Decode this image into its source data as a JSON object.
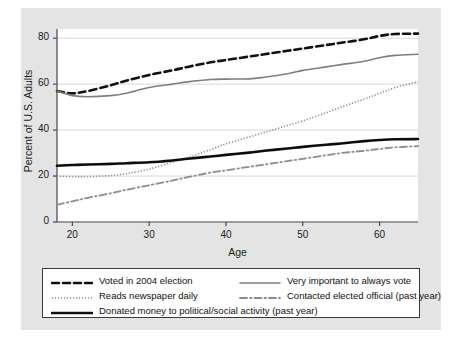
{
  "chart_data": {
    "type": "line",
    "title": "",
    "xlabel": "Age",
    "ylabel": "Percent of U.S. Adults",
    "xlim": [
      18,
      65
    ],
    "ylim": [
      0,
      84
    ],
    "grid": true,
    "legend_position": "below-plot",
    "xticks": [
      20,
      30,
      40,
      50,
      60
    ],
    "yticks": [
      0,
      20,
      40,
      60,
      80
    ],
    "x": [
      18,
      20,
      22,
      25,
      27,
      30,
      33,
      35,
      38,
      40,
      43,
      45,
      48,
      50,
      53,
      55,
      58,
      60,
      62,
      65
    ],
    "series": [
      {
        "name": "Voted in 2004 election",
        "style": "dashed",
        "color": "#111111",
        "width": 2.6,
        "values": [
          57.0,
          56.0,
          57.0,
          59.5,
          61.5,
          64.0,
          66.0,
          67.5,
          69.5,
          70.5,
          72.0,
          73.0,
          74.5,
          75.5,
          77.0,
          78.0,
          79.5,
          81.0,
          81.8,
          82.0
        ]
      },
      {
        "name": "Very important to always vote",
        "style": "solid",
        "color": "#7f7f7f",
        "width": 1.6,
        "values": [
          57.0,
          55.0,
          54.5,
          55.0,
          56.0,
          58.5,
          60.0,
          61.0,
          62.0,
          62.2,
          62.3,
          63.0,
          64.5,
          66.0,
          67.5,
          68.5,
          70.0,
          71.5,
          72.5,
          73.0
        ]
      },
      {
        "name": "Reads newspaper daily",
        "style": "dotted",
        "color": "#8c8c8c",
        "width": 1.6,
        "values": [
          20.0,
          19.8,
          19.8,
          20.2,
          21.0,
          23.0,
          26.0,
          28.0,
          31.5,
          34.0,
          37.0,
          39.0,
          42.0,
          44.0,
          47.5,
          50.0,
          53.5,
          56.0,
          58.5,
          61.0
        ]
      },
      {
        "name": "Contacted elected official (past year)",
        "style": "dashdot",
        "color": "#8c8c8c",
        "width": 1.8,
        "values": [
          7.5,
          9.0,
          10.5,
          12.5,
          14.0,
          16.0,
          18.0,
          19.5,
          21.5,
          22.5,
          24.0,
          25.0,
          26.5,
          27.5,
          29.0,
          30.0,
          31.0,
          31.8,
          32.5,
          33.0
        ]
      },
      {
        "name": "Donated money to political/social activity (past year)",
        "style": "solid",
        "color": "#0d0d0d",
        "width": 2.6,
        "values": [
          24.5,
          24.8,
          25.0,
          25.3,
          25.6,
          26.0,
          26.8,
          27.5,
          28.5,
          29.2,
          30.2,
          31.0,
          32.0,
          32.7,
          33.6,
          34.2,
          35.2,
          35.7,
          36.0,
          36.1
        ]
      }
    ]
  },
  "axes": {
    "ytick_labels": [
      "0",
      "20",
      "40",
      "60",
      "80"
    ],
    "xtick_labels": [
      "20",
      "30",
      "40",
      "50",
      "60"
    ],
    "ylabel": "Percent of U.S. Adults",
    "xlabel": "Age"
  },
  "legend": {
    "entries": [
      {
        "label": "Voted in 2004 election",
        "key": "dashed-black"
      },
      {
        "label": "Very important to always vote",
        "key": "solid-gray"
      },
      {
        "label": "Reads newspaper daily",
        "key": "dotted-gray"
      },
      {
        "label": "Contacted elected official (past year)",
        "key": "dashdot-gray"
      },
      {
        "label": "Donated money to political/social activity (past year)",
        "key": "solid-black"
      }
    ]
  }
}
